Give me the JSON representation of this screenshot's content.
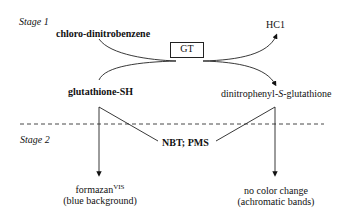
{
  "stage1": {
    "label": "Stage 1",
    "substrate1": "chloro-dinitrobenzene",
    "substrate2": "glutathione-SH",
    "enzyme": "GT",
    "product1": "HC1",
    "product2_pre": "dinitrophenyl-",
    "product2_italic": "S",
    "product2_post": "-glutathione"
  },
  "stage2": {
    "label": "Stage 2",
    "reagents": "NBT; PMS",
    "left_result_main": "formazan",
    "left_result_sup": "VIS",
    "left_result_note": "(blue background)",
    "right_result_main": "no color change",
    "right_result_note": "(achromatic bands)"
  }
}
